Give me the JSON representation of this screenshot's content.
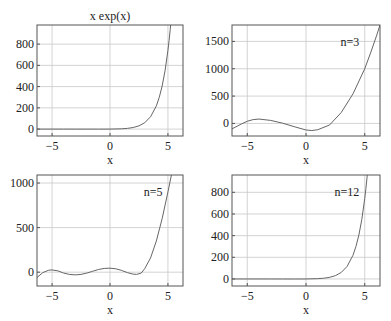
{
  "chart_data": [
    {
      "type": "line",
      "title": "x exp(x)",
      "annotation": "",
      "xlabel": "x",
      "ylabel": "",
      "xlim": [
        -6.3,
        6.3
      ],
      "ylim": [
        -65,
        980
      ],
      "xticks": [
        -5,
        0,
        5
      ],
      "xtick_labels": [
        "−5",
        "0",
        "5"
      ],
      "yticks": [
        0,
        200,
        400,
        600,
        800
      ],
      "ytick_labels": [
        "0",
        "200",
        "400",
        "600",
        "800"
      ],
      "grid": true,
      "box": {
        "left": 37,
        "top": 25,
        "right": 183,
        "bottom": 136
      },
      "series": [
        {
          "name": "x exp(x)",
          "x": [
            -6.3,
            -5,
            -4,
            -3,
            -2,
            -1,
            0,
            1,
            1.5,
            2,
            2.5,
            3,
            3.5,
            4,
            4.25,
            4.5,
            4.75,
            5,
            5.1,
            5.2,
            5.25,
            5.3
          ],
          "y": [
            -0.01,
            -0.03,
            -0.07,
            -0.15,
            -0.27,
            -0.37,
            0,
            2.7,
            6.7,
            14.8,
            30.5,
            60.3,
            115.9,
            218.4,
            298.7,
            405.1,
            548.2,
            742.1,
            835.7,
            939.8,
            996.2,
            1061
          ]
        }
      ]
    },
    {
      "type": "line",
      "title": "",
      "annotation": "n=3",
      "xlabel": "x",
      "ylabel": "",
      "xlim": [
        -6.3,
        6.3
      ],
      "ylim": [
        -230,
        1800
      ],
      "xticks": [
        -5,
        0,
        5
      ],
      "xtick_labels": [
        "−5",
        "0",
        "5"
      ],
      "yticks": [
        0,
        500,
        1000,
        1500
      ],
      "ytick_labels": [
        "0",
        "500",
        "1000",
        "1500"
      ],
      "grid": true,
      "box": {
        "left": 232,
        "top": 25,
        "right": 380,
        "bottom": 136
      },
      "series": [
        {
          "name": "n=3",
          "x": [
            -6.3,
            -5.5,
            -5,
            -4.5,
            -4,
            -3,
            -2,
            -1,
            0,
            0.5,
            1,
            2,
            3,
            4,
            5,
            5.5,
            6,
            6.3
          ],
          "y": [
            -100,
            -10,
            40,
            70,
            80,
            55,
            5,
            -60,
            -120,
            -130,
            -115,
            -30,
            200,
            540,
            1000,
            1290,
            1600,
            1800
          ]
        }
      ]
    },
    {
      "type": "line",
      "title": "",
      "annotation": "n=5",
      "xlabel": "x",
      "ylabel": "",
      "xlim": [
        -6.3,
        6.3
      ],
      "ylim": [
        -155,
        1090
      ],
      "xticks": [
        -5,
        0,
        5
      ],
      "xtick_labels": [
        "−5",
        "0",
        "5"
      ],
      "yticks": [
        0,
        500,
        1000
      ],
      "ytick_labels": [
        "0",
        "500",
        "1000"
      ],
      "grid": true,
      "box": {
        "left": 37,
        "top": 175,
        "right": 183,
        "bottom": 286
      },
      "series": [
        {
          "name": "n=5",
          "x": [
            -6.3,
            -5.8,
            -5.3,
            -5,
            -4.5,
            -4,
            -3.5,
            -3,
            -2.5,
            -2,
            -1.5,
            -1,
            -0.5,
            0,
            0.5,
            1,
            1.5,
            2,
            2.3,
            2.7,
            3,
            3.5,
            4,
            4.5,
            5,
            5.3
          ],
          "y": [
            -60,
            -5,
            22,
            25,
            15,
            -10,
            -25,
            -30,
            -25,
            -10,
            10,
            30,
            42,
            45,
            38,
            20,
            -5,
            -22,
            -25,
            -10,
            40,
            160,
            350,
            600,
            900,
            1090
          ]
        }
      ]
    },
    {
      "type": "line",
      "title": "",
      "annotation": "n=12",
      "xlabel": "x",
      "ylabel": "",
      "xlim": [
        -6.3,
        6.3
      ],
      "ylim": [
        -65,
        960
      ],
      "xticks": [
        -5,
        0,
        5
      ],
      "xtick_labels": [
        "−5",
        "0",
        "5"
      ],
      "yticks": [
        0,
        200,
        400,
        600,
        800
      ],
      "ytick_labels": [
        "0",
        "200",
        "400",
        "600",
        "800"
      ],
      "grid": true,
      "box": {
        "left": 232,
        "top": 175,
        "right": 380,
        "bottom": 286
      },
      "series": [
        {
          "name": "n=12",
          "x": [
            -6.3,
            -5,
            -4,
            -3,
            -2,
            -1,
            0,
            1,
            1.5,
            2,
            2.5,
            3,
            3.5,
            4,
            4.25,
            4.5,
            4.75,
            5,
            5.1,
            5.2,
            5.25
          ],
          "y": [
            0,
            0,
            0,
            -0.15,
            -0.27,
            -0.37,
            0,
            2.7,
            6.7,
            14.8,
            30.5,
            60.3,
            115.9,
            218.4,
            298.7,
            405.1,
            548.2,
            742.1,
            835.7,
            939.8,
            996.2
          ]
        }
      ]
    }
  ],
  "colors": {
    "curve": "#666666",
    "grid": "#c8c8c8",
    "frame": "#555555",
    "text": "#222222"
  }
}
